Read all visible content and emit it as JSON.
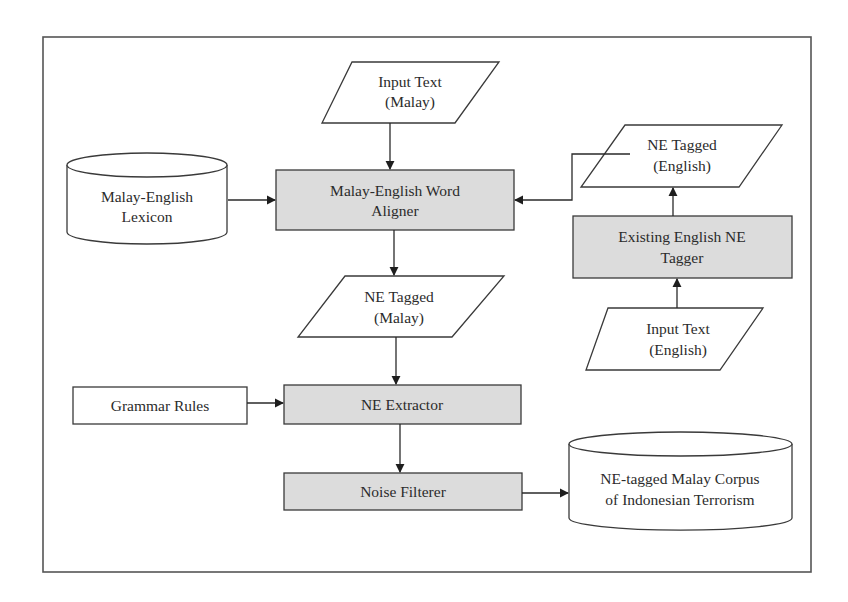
{
  "diagram": {
    "colors": {
      "process_fill": "#dcdcdc",
      "data_fill": "#ffffff",
      "stroke": "#3a3a3a",
      "frame": "#555555"
    },
    "nodes": {
      "input_text_malay": {
        "type": "data",
        "line1": "Input Text",
        "line2": "(Malay)"
      },
      "lexicon": {
        "type": "store",
        "line1": "Malay-English",
        "line2": "Lexicon"
      },
      "word_aligner": {
        "type": "process",
        "line1": "Malay-English Word",
        "line2": "Aligner"
      },
      "ne_tagged_english": {
        "type": "data",
        "line1": "NE Tagged",
        "line2": "(English)"
      },
      "english_ne_tagger": {
        "type": "process",
        "line1": "Existing English NE",
        "line2": "Tagger"
      },
      "input_text_english": {
        "type": "data",
        "line1": "Input Text",
        "line2": "(English)"
      },
      "ne_tagged_malay": {
        "type": "data",
        "line1": "NE Tagged",
        "line2": "(Malay)"
      },
      "grammar_rules": {
        "type": "input",
        "label": "Grammar Rules"
      },
      "ne_extractor": {
        "type": "process",
        "label": "NE Extractor"
      },
      "noise_filterer": {
        "type": "process",
        "label": "Noise Filterer"
      },
      "corpus": {
        "type": "store",
        "line1": "NE-tagged Malay Corpus",
        "line2": "of Indonesian Terrorism"
      }
    },
    "edges": [
      {
        "from": "input_text_malay",
        "to": "word_aligner"
      },
      {
        "from": "lexicon",
        "to": "word_aligner"
      },
      {
        "from": "ne_tagged_english",
        "to": "word_aligner"
      },
      {
        "from": "input_text_english",
        "to": "english_ne_tagger"
      },
      {
        "from": "english_ne_tagger",
        "to": "ne_tagged_english"
      },
      {
        "from": "word_aligner",
        "to": "ne_tagged_malay"
      },
      {
        "from": "ne_tagged_malay",
        "to": "ne_extractor"
      },
      {
        "from": "grammar_rules",
        "to": "ne_extractor"
      },
      {
        "from": "ne_extractor",
        "to": "noise_filterer"
      },
      {
        "from": "noise_filterer",
        "to": "corpus"
      }
    ]
  }
}
